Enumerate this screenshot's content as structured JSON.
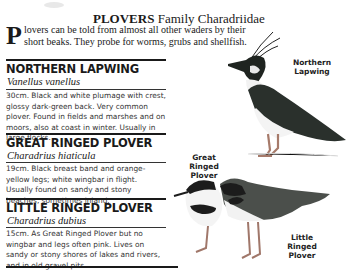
{
  "header": {
    "title_bold": "PLOVERS",
    "title_rest": " Family Charadriidae",
    "dropcap": "P",
    "intro": "lovers can be told from almost all other waders by their short beaks. They probe for worms, grubs and shellfish."
  },
  "species": [
    {
      "name": "NORTHERN LAPWING",
      "latin": "Vanellus vanellus",
      "description": "30cm. Black and white plumage with crest, glossy dark-green back. Very common plover. Found in fields and marshes and on moors, also at coast in winter. Usually in large flocks."
    },
    {
      "name": "GREAT RINGED PLOVER",
      "latin": "Charadrius hiaticula",
      "description": "19cm. Black breast band and orange-yellow legs; white wingbar in flight. Usually found on sandy and stony beaches, sometimes inland."
    },
    {
      "name": "LITTLE RINGED PLOVER",
      "latin": "Charadrius dubius",
      "description": "15cm. As Great Ringed Plover but no wingbar and legs often pink. Lives on sandy or stony shores of lakes and rivers, and in old gravel pits."
    }
  ],
  "illustration_labels": {
    "lapwing": "Northern Lapwing",
    "great_ringed": "Great Ringed Plover",
    "little_ringed": "Little Ringed Plover"
  }
}
